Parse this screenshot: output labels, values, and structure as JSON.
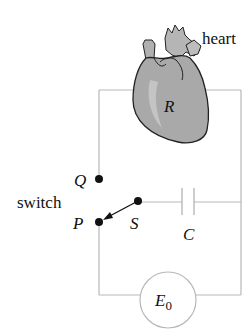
{
  "diagram": {
    "type": "circuit",
    "labels": {
      "heart": "heart",
      "resistor": "R",
      "switch": "switch",
      "node_q": "Q",
      "node_p": "P",
      "node_s": "S",
      "capacitor": "C",
      "source_main": "E",
      "source_sub": "0"
    },
    "colors": {
      "wire": "#b8b8b8",
      "heart_fill": "#a9a9a9",
      "heart_light": "#c4c4c4",
      "heart_outline": "#222222",
      "dot": "#111111",
      "text": "#111111"
    },
    "components": [
      {
        "id": "R",
        "kind": "resistor",
        "represented_by": "heart"
      },
      {
        "id": "C",
        "kind": "capacitor"
      },
      {
        "id": "E0",
        "kind": "voltage_source"
      },
      {
        "id": "switch",
        "kind": "spdt_switch",
        "common": "S",
        "positions": [
          "Q",
          "P"
        ],
        "current_position": "P"
      }
    ]
  }
}
